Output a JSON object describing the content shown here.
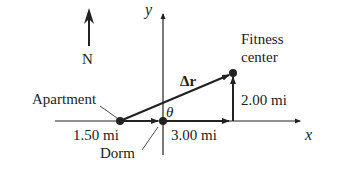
{
  "diagram": {
    "compass": {
      "label": "N",
      "direction": "north"
    },
    "axes": {
      "x_label": "x",
      "y_label": "y"
    },
    "points": {
      "apartment": {
        "label": "Apartment"
      },
      "dorm": {
        "label": "Dorm"
      },
      "fitness": {
        "label_line1": "Fitness",
        "label_line2": "center"
      }
    },
    "segments": {
      "apartment_to_dorm": "1.50 mi",
      "dorm_east": "3.00 mi",
      "north_leg": "2.00 mi"
    },
    "displacement_label": "Δr⃗",
    "angle_label": "θ",
    "colors": {
      "ink": "#222222",
      "background": "#ffffff"
    }
  }
}
